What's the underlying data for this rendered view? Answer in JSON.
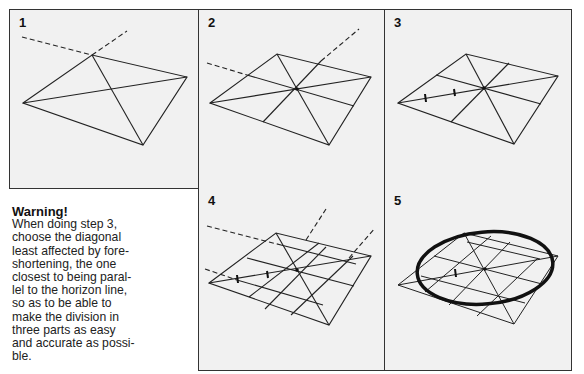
{
  "figure": {
    "panels": [
      {
        "number": "1",
        "label": "Step 1: draw quadrilateral and diagonals with vanishing lines"
      },
      {
        "number": "2",
        "label": "Step 2: draw central dividing lines through the center"
      },
      {
        "number": "3",
        "label": "Step 3: divide one diagonal into three parts"
      },
      {
        "number": "4",
        "label": "Step 4: draw grid lines through the division marks"
      },
      {
        "number": "5",
        "label": "Step 5: draw the ellipse through the grid points"
      }
    ],
    "warning": {
      "title": "Warning!",
      "lines": [
        "When doing step 3,",
        "choose the diagonal",
        "least affected by fore-",
        "shortening, the one",
        "closest to being paral-",
        "lel to the horizon line,",
        "so as to be able to",
        "make the division in",
        "three parts as easy",
        "and accurate as possi-",
        "ble."
      ]
    }
  }
}
